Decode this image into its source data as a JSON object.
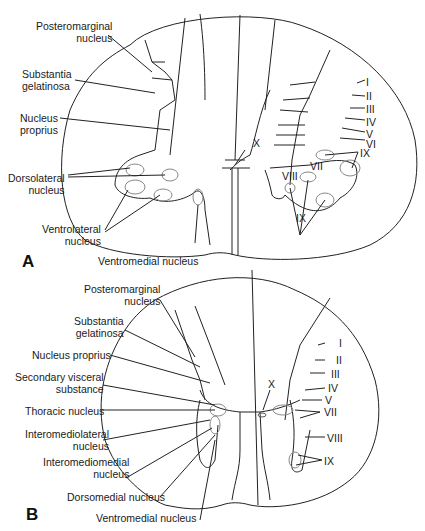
{
  "panelA": {
    "letter": "A",
    "labels": {
      "posteromarginal_1": "Posteromarginal",
      "posteromarginal_2": "nucleus",
      "substantia_1": "Substantia",
      "substantia_2": "gelatinosa",
      "proprius_1": "Nucleus",
      "proprius_2": "proprius",
      "dorsolateral_1": "Dorsolateral",
      "dorsolateral_2": "nucleus",
      "ventrolateral_1": "Ventrolateral",
      "ventrolateral_2": "nucleus",
      "ventromedial": "Ventromedial nucleus",
      "laminae": [
        "I",
        "II",
        "III",
        "IV",
        "V",
        "VI",
        "VII",
        "VIII",
        "IX",
        "IX",
        "X"
      ]
    }
  },
  "panelB": {
    "letter": "B",
    "labels": {
      "posteromarginal_1": "Posteromarginal",
      "posteromarginal_2": "nucleus",
      "substantia_1": "Substantia",
      "substantia_2": "gelatinosa",
      "proprius": "Nucleus proprius",
      "secondary_1": "Secondary visceral",
      "secondary_2": "substance",
      "thoracic": "Thoracic nucleus",
      "interomediolateral_1": "Interomediolateral",
      "interomediolateral_2": "nucleus",
      "interomediomedial_1": "Interomediomedial",
      "interomediomedial_2": "nucleus",
      "dorsomedial": "Dorsomedial nucleus",
      "ventromedial": "Ventromedial nucleus",
      "laminae": [
        "I",
        "II",
        "III",
        "IV",
        "V",
        "VII",
        "VIII",
        "IX",
        "X"
      ]
    }
  }
}
